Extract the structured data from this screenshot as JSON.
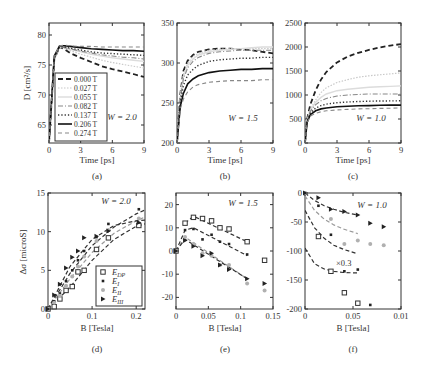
{
  "figure": {
    "panels_labels": [
      "(a)",
      "(b)",
      "(c)",
      "(d)",
      "(e)",
      "(f)"
    ]
  },
  "legend_a": {
    "entries": [
      {
        "label": "0.000 T",
        "style": "dash-bold",
        "color": "#222222"
      },
      {
        "label": "0.027 T",
        "style": "dot-light",
        "color": "#d0d0d0"
      },
      {
        "label": "0.055 T",
        "style": "solid-light",
        "color": "#e0e0e0"
      },
      {
        "label": "0.082 T",
        "style": "dashdot",
        "color": "#888888"
      },
      {
        "label": "0.137 T",
        "style": "dotted",
        "color": "#333333"
      },
      {
        "label": "0.206 T",
        "style": "solid-bold",
        "color": "#111111"
      },
      {
        "label": "0.274 T",
        "style": "dash-gray",
        "color": "#888888"
      }
    ]
  },
  "legend_d": {
    "entries": [
      {
        "label": "E",
        "sub": "DP",
        "marker": "square-open",
        "color": "#333333"
      },
      {
        "label": "E",
        "sub": "I",
        "marker": "small-filled",
        "color": "#222222"
      },
      {
        "label": "E",
        "sub": "II",
        "marker": "diamond",
        "color": "#aaaaaa"
      },
      {
        "label": "E",
        "sub": "III",
        "marker": "triangle-right",
        "color": "#222222"
      }
    ]
  },
  "chart_data": [
    {
      "id": "a",
      "type": "line",
      "panel_label": "(a)",
      "xlabel": "Time [ps]",
      "ylabel": "D [cm²/s]",
      "xlim": [
        0,
        9
      ],
      "ylim": [
        62,
        82
      ],
      "xticks": [
        0,
        3,
        6,
        9
      ],
      "yticks": [
        65,
        70,
        75,
        80
      ],
      "annotation": "W = 2.0",
      "x": [
        0,
        0.5,
        1,
        1.5,
        2,
        3,
        4,
        5,
        6,
        7,
        8,
        9
      ],
      "series": [
        {
          "name": "0.000 T",
          "values": [
            62,
            76,
            78.0,
            77.6,
            77.0,
            76.2,
            75.5,
            74.8,
            74.3,
            73.9,
            73.5,
            73.0
          ]
        },
        {
          "name": "0.027 T",
          "values": [
            62,
            76,
            78.0,
            77.8,
            77.4,
            76.8,
            76.3,
            75.8,
            75.4,
            75.1,
            74.8,
            74.5
          ]
        },
        {
          "name": "0.055 T",
          "values": [
            62,
            76,
            78.0,
            77.9,
            77.6,
            77.2,
            76.8,
            76.5,
            76.2,
            76.0,
            75.8,
            75.6
          ]
        },
        {
          "name": "0.082 T",
          "values": [
            62,
            76,
            78.0,
            77.9,
            77.7,
            77.3,
            77.0,
            76.7,
            76.5,
            76.3,
            76.2,
            76.0
          ]
        },
        {
          "name": "0.137 T",
          "values": [
            62,
            76,
            78.0,
            78.0,
            77.8,
            77.5,
            77.2,
            77.0,
            76.9,
            76.8,
            76.7,
            76.6
          ]
        },
        {
          "name": "0.206 T",
          "values": [
            62,
            76.5,
            78.2,
            78.2,
            78.1,
            77.9,
            77.7,
            77.6,
            77.5,
            77.4,
            77.4,
            77.3
          ]
        },
        {
          "name": "0.274 T",
          "values": [
            62,
            76.5,
            78.2,
            78.3,
            78.2,
            78.1,
            78.1,
            78.0,
            78.0,
            78.0,
            78.0,
            78.0
          ]
        }
      ]
    },
    {
      "id": "b",
      "type": "line",
      "panel_label": "(b)",
      "xlabel": "Time [ps]",
      "ylabel": "",
      "xlim": [
        0,
        9
      ],
      "ylim": [
        200,
        350
      ],
      "xticks": [
        0,
        3,
        6,
        9
      ],
      "yticks": [
        200,
        250,
        300,
        350
      ],
      "annotation": "W = 1.5",
      "x": [
        0,
        0.3,
        0.6,
        1,
        1.5,
        2,
        3,
        4,
        5,
        6,
        7,
        8,
        9
      ],
      "series": [
        {
          "name": "0.000 T",
          "values": [
            200,
            260,
            290,
            303,
            310,
            314,
            317,
            318,
            318,
            317,
            316,
            314,
            312
          ]
        },
        {
          "name": "0.027 T",
          "values": [
            200,
            258,
            286,
            300,
            308,
            312,
            316,
            317,
            318,
            318,
            318,
            318,
            318
          ]
        },
        {
          "name": "0.055 T",
          "values": [
            200,
            256,
            283,
            297,
            305,
            310,
            314,
            316,
            317,
            318,
            319,
            320,
            320
          ]
        },
        {
          "name": "0.082 T",
          "values": [
            200,
            255,
            280,
            294,
            302,
            307,
            312,
            314,
            315,
            316,
            316,
            316,
            316
          ]
        },
        {
          "name": "0.137 T",
          "values": [
            200,
            250,
            272,
            285,
            292,
            297,
            302,
            304,
            305,
            306,
            306,
            307,
            307
          ]
        },
        {
          "name": "0.206 T",
          "values": [
            200,
            245,
            262,
            274,
            280,
            284,
            288,
            290,
            291,
            292,
            292,
            293,
            293
          ]
        },
        {
          "name": "0.274 T",
          "values": [
            200,
            242,
            255,
            264,
            270,
            273,
            276,
            277,
            278,
            278,
            278,
            279,
            279
          ]
        }
      ]
    },
    {
      "id": "c",
      "type": "line",
      "panel_label": "(c)",
      "xlabel": "Time [ps]",
      "ylabel": "",
      "xlim": [
        0,
        9
      ],
      "ylim": [
        0,
        2500
      ],
      "xticks": [
        0,
        3,
        6,
        9
      ],
      "yticks": [
        0,
        500,
        1000,
        1500,
        2000,
        2500
      ],
      "annotation": "W = 1.0",
      "x": [
        0,
        0.2,
        0.5,
        1,
        1.5,
        2,
        3,
        4,
        5,
        6,
        7,
        8,
        9
      ],
      "series": [
        {
          "name": "0.000 T",
          "values": [
            0,
            500,
            800,
            1100,
            1320,
            1480,
            1680,
            1800,
            1880,
            1940,
            1990,
            2030,
            2060
          ]
        },
        {
          "name": "0.027 T",
          "values": [
            0,
            480,
            700,
            900,
            1050,
            1150,
            1260,
            1320,
            1370,
            1400,
            1420,
            1440,
            1460
          ]
        },
        {
          "name": "0.055 T",
          "values": [
            0,
            470,
            680,
            850,
            950,
            1020,
            1090,
            1120,
            1140,
            1160,
            1170,
            1180,
            1190
          ]
        },
        {
          "name": "0.082 T",
          "values": [
            0,
            460,
            660,
            800,
            880,
            930,
            980,
            1000,
            1010,
            1020,
            1020,
            1020,
            1020
          ]
        },
        {
          "name": "0.137 T",
          "values": [
            0,
            450,
            620,
            730,
            780,
            810,
            840,
            855,
            865,
            870,
            875,
            878,
            880
          ]
        },
        {
          "name": "0.206 T",
          "values": [
            0,
            430,
            590,
            670,
            710,
            730,
            755,
            765,
            775,
            780,
            785,
            790,
            790
          ]
        },
        {
          "name": "0.274 T",
          "values": [
            0,
            420,
            560,
            620,
            650,
            670,
            690,
            700,
            710,
            715,
            720,
            725,
            730
          ]
        }
      ]
    },
    {
      "id": "d",
      "type": "scatter",
      "panel_label": "(d)",
      "xlabel": "B [Tesla]",
      "ylabel": "Δσ [microS]",
      "xlim": [
        0,
        0.22
      ],
      "ylim": [
        0,
        15
      ],
      "xticks": [
        0,
        0.1,
        0.2
      ],
      "xticklabels": [
        "0",
        "0.1",
        "0.2"
      ],
      "yticks": [
        0,
        5,
        10,
        15
      ],
      "annotation": "W = 2.0",
      "series": [
        {
          "name": "E_DP",
          "x": [
            0,
            0.014,
            0.027,
            0.041,
            0.055,
            0.068,
            0.082,
            0.11,
            0.137,
            0.206
          ],
          "values": [
            0,
            0.3,
            1.3,
            2.4,
            2.9,
            4.8,
            5.0,
            7.7,
            9.2,
            10.8
          ],
          "fit": {
            "x": [
              0,
              0.05,
              0.1,
              0.15,
              0.2,
              0.22
            ],
            "y": [
              0,
              2.8,
              6.3,
              9.0,
              10.7,
              11.0
            ]
          }
        },
        {
          "name": "E_I",
          "x": [
            0,
            0.014,
            0.027,
            0.041,
            0.055,
            0.068,
            0.082,
            0.11,
            0.137,
            0.206
          ],
          "values": [
            0,
            1.0,
            2.0,
            3.6,
            5.0,
            6.3,
            7.5,
            9.3,
            11.0,
            12.9
          ],
          "fit": {
            "x": [
              0,
              0.05,
              0.1,
              0.15,
              0.2,
              0.22
            ],
            "y": [
              0,
              4.6,
              8.2,
              10.6,
              12.3,
              12.8
            ]
          }
        },
        {
          "name": "E_II",
          "x": [
            0,
            0.014,
            0.027,
            0.041,
            0.055,
            0.068,
            0.082,
            0.11,
            0.137,
            0.206
          ],
          "values": [
            0,
            0.8,
            1.7,
            3.0,
            4.2,
            5.5,
            6.8,
            8.8,
            10.2,
            11.7
          ],
          "fit": {
            "x": [
              0,
              0.05,
              0.1,
              0.15,
              0.2,
              0.22
            ],
            "y": [
              0,
              3.9,
              7.3,
              9.8,
              11.4,
              11.9
            ]
          }
        },
        {
          "name": "E_III",
          "x": [
            0,
            0.014,
            0.027,
            0.041,
            0.055,
            0.068,
            0.082,
            0.11,
            0.137,
            0.206
          ],
          "values": [
            0,
            1.8,
            3.2,
            5.3,
            6.7,
            7.5,
            9.2,
            9.4,
            10.1,
            11.2
          ],
          "fit": {
            "x": [
              0,
              0.05,
              0.1,
              0.15,
              0.2,
              0.22
            ],
            "y": [
              0,
              5.5,
              9.0,
              10.8,
              11.4,
              11.5
            ]
          }
        }
      ],
      "legend": [
        "E_DP",
        "E_I",
        "E_II",
        "E_III"
      ],
      "legend_position": "lower right"
    },
    {
      "id": "e",
      "type": "scatter",
      "panel_label": "(e)",
      "xlabel": "B [Tesla]",
      "ylabel": "",
      "xlim": [
        0,
        0.15
      ],
      "ylim": [
        -25,
        25
      ],
      "xticks": [
        0,
        0.05,
        0.1,
        0.15
      ],
      "xticklabels": [
        "0",
        "0.05",
        "0.1",
        "0.15"
      ],
      "yticks": [
        -20,
        -10,
        0,
        10,
        20
      ],
      "annotation": "W = 1.5",
      "series": [
        {
          "name": "E_DP",
          "x": [
            0,
            0.014,
            0.027,
            0.041,
            0.055,
            0.068,
            0.082,
            0.11,
            0.137
          ],
          "values": [
            0,
            12,
            14.5,
            14,
            13,
            10,
            9.5,
            4,
            -4
          ],
          "fit": {
            "x": [
              0.014,
              0.027,
              0.11
            ],
            "y": [
              12,
              15,
              4
            ]
          }
        },
        {
          "name": "E_I",
          "x": [
            0,
            0.014,
            0.027,
            0.041,
            0.055,
            0.068,
            0.082,
            0.11
          ],
          "values": [
            0,
            9,
            9.5,
            5,
            7,
            4,
            3,
            -1.5
          ],
          "fit": {
            "x": [
              0,
              0.014,
              0.027,
              0.11
            ],
            "y": [
              0,
              9,
              10,
              -2
            ]
          }
        },
        {
          "name": "E_II",
          "x": [
            0,
            0.014,
            0.027,
            0.041,
            0.055,
            0.068,
            0.082,
            0.11,
            0.137
          ],
          "values": [
            0,
            6,
            3,
            -1,
            -2,
            -6,
            -6,
            -14,
            -17
          ],
          "fit": {
            "x": [
              0,
              0.014,
              0.11
            ],
            "y": [
              0,
              6,
              -12
            ]
          }
        },
        {
          "name": "E_III",
          "x": [
            0,
            0.014,
            0.027,
            0.041,
            0.055,
            0.068,
            0.082,
            0.11,
            0.137
          ],
          "values": [
            0,
            4.5,
            2,
            -2,
            -1,
            -6,
            -8,
            -12,
            -14
          ],
          "fit": {
            "x": [
              0,
              0.014,
              0.11
            ],
            "y": [
              0,
              5,
              -12
            ]
          }
        }
      ]
    },
    {
      "id": "f",
      "type": "scatter",
      "panel_label": "(f)",
      "xlabel": "B [Tesla]",
      "ylabel": "",
      "xlim": [
        0,
        0.1
      ],
      "ylim": [
        -200,
        0
      ],
      "xticks": [
        0,
        0.05,
        0.1
      ],
      "xticklabels": [
        "0",
        "0.05",
        "0.01"
      ],
      "yticks": [
        -200,
        -150,
        -100,
        -50,
        0
      ],
      "annotation": "W = 1.0",
      "scale_note": "×0.3",
      "series": [
        {
          "name": "E_DP",
          "x": [
            0.014,
            0.027,
            0.041,
            0.055
          ],
          "values": [
            -75,
            -135,
            -172,
            -190
          ],
          "fit": {
            "x": [
              0,
              0.01,
              0.02,
              0.03,
              0.04,
              0.055
            ],
            "y": [
              -95,
              -122,
              -131,
              -135,
              -137,
              -138
            ]
          }
        },
        {
          "name": "E_I",
          "x": [
            0,
            0.014,
            0.027,
            0.041,
            0.055,
            0.068
          ],
          "values": [
            0,
            -22,
            -72,
            -135,
            -132,
            -193
          ],
          "fit": {
            "x": [
              0,
              0.01,
              0.02,
              0.03,
              0.04,
              0.055
            ],
            "y": [
              -30,
              -60,
              -78,
              -90,
              -97,
              -105
            ]
          }
        },
        {
          "name": "E_II",
          "x": [
            0,
            0.027,
            0.041,
            0.055,
            0.068,
            0.082
          ],
          "values": [
            0,
            -45,
            -88,
            -82,
            -88,
            -90
          ],
          "fit": {
            "x": [
              0,
              0.01,
              0.02,
              0.03,
              0.04,
              0.055
            ],
            "y": [
              -5,
              -30,
              -45,
              -55,
              -62,
              -70
            ]
          }
        },
        {
          "name": "E_III",
          "x": [
            0,
            0.014,
            0.027,
            0.041,
            0.055,
            0.068,
            0.082
          ],
          "values": [
            0,
            -8,
            -28,
            -32,
            -38,
            -52,
            -58
          ],
          "fit": {
            "x": [
              0,
              0.01,
              0.02,
              0.03,
              0.04,
              0.055
            ],
            "y": [
              0,
              -13,
              -22,
              -28,
              -33,
              -38
            ]
          }
        }
      ]
    }
  ]
}
